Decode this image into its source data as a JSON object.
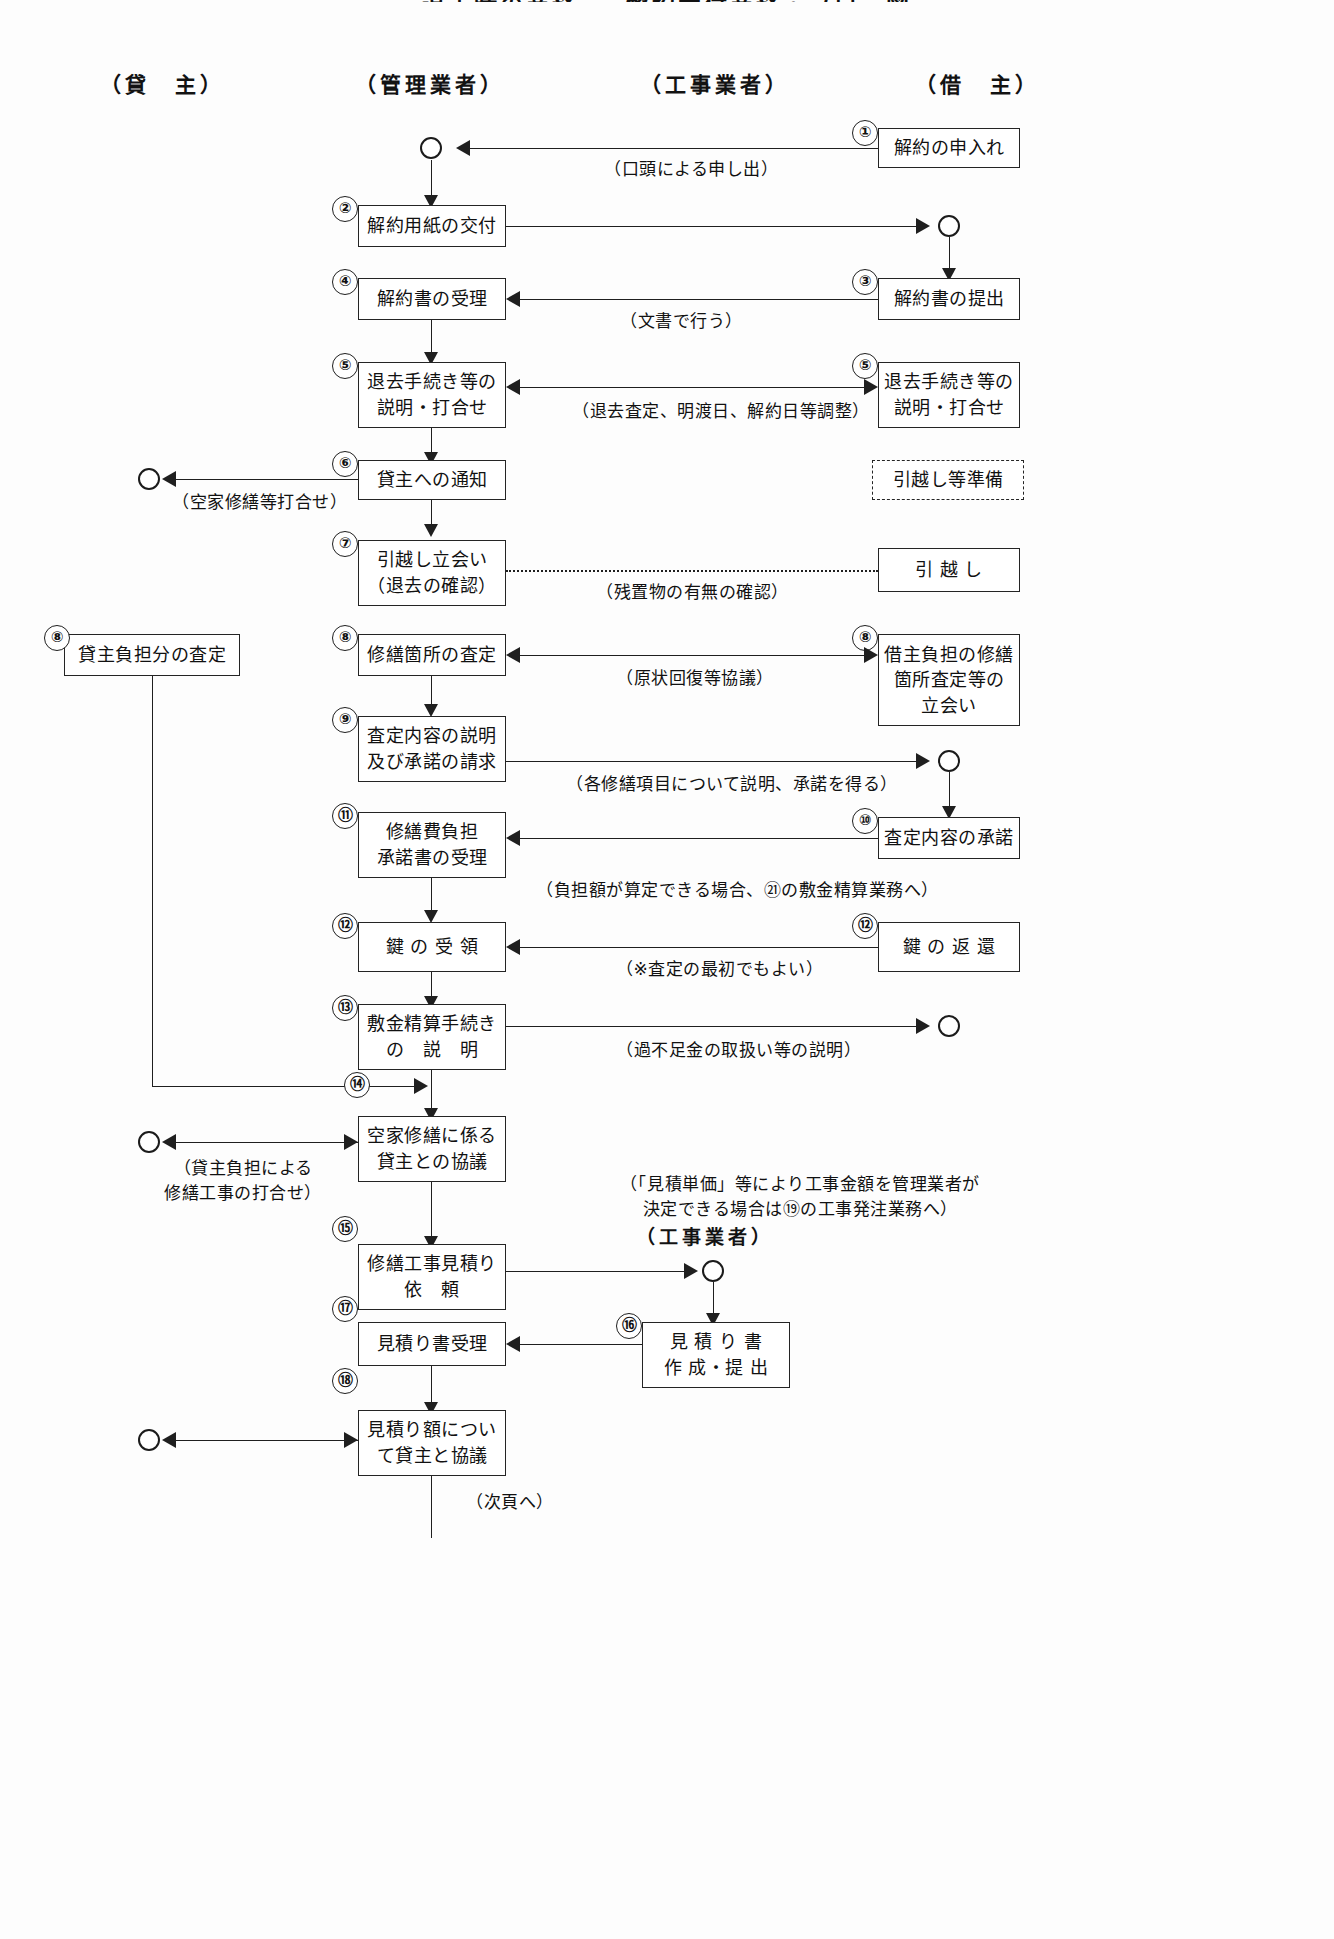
{
  "title": "退去時の業務 — 解約受付業務・フロー図",
  "columns": [
    {
      "id": "lender",
      "label": "（貸　主）"
    },
    {
      "id": "manager",
      "label": "（管理業者）"
    },
    {
      "id": "contractor",
      "label": "（工事業者）"
    },
    {
      "id": "tenant",
      "label": "（借　主）"
    }
  ],
  "contractor_label_lower": "（工事業者）",
  "footer_note": "（次頁へ）",
  "steps": {
    "s01": {
      "num": "①",
      "lines": [
        "解約の申入れ"
      ]
    },
    "s02": {
      "num": "②",
      "lines": [
        "解約用紙の交付"
      ]
    },
    "s03": {
      "num": "③",
      "lines": [
        "解約書の提出"
      ]
    },
    "s04": {
      "num": "④",
      "lines": [
        "解約書の受理"
      ]
    },
    "s05m": {
      "num": "⑤",
      "lines": [
        "退去手続き等の",
        "説明・打合せ"
      ]
    },
    "s05t": {
      "num": "⑤",
      "lines": [
        "退去手続き等の",
        "説明・打合せ"
      ]
    },
    "s06": {
      "num": "⑥",
      "lines": [
        "貸主への通知"
      ]
    },
    "s06t": {
      "num": "",
      "lines": [
        "引越し等準備"
      ]
    },
    "s07": {
      "num": "⑦",
      "lines": [
        "引越し立会い",
        "（退去の確認）"
      ]
    },
    "s07t": {
      "num": "",
      "lines": [
        "引 越 し"
      ]
    },
    "s08l": {
      "num": "⑧",
      "lines": [
        "貸主負担分の査定"
      ]
    },
    "s08m": {
      "num": "⑧",
      "lines": [
        "修繕箇所の査定"
      ]
    },
    "s08t": {
      "num": "⑧",
      "lines": [
        "借主負担の修繕",
        "箇所査定等の",
        "立会い"
      ]
    },
    "s09": {
      "num": "⑨",
      "lines": [
        "査定内容の説明",
        "及び承諾の請求"
      ]
    },
    "s10": {
      "num": "⑩",
      "lines": [
        "査定内容の承諾"
      ]
    },
    "s11": {
      "num": "⑪",
      "lines": [
        "修繕費負担",
        "承諾書の受理"
      ]
    },
    "s12m": {
      "num": "⑫",
      "lines": [
        "鍵 の 受 領"
      ]
    },
    "s12t": {
      "num": "⑫",
      "lines": [
        "鍵 の 返 還"
      ]
    },
    "s13": {
      "num": "⑬",
      "lines": [
        "敷金精算手続き",
        "の　説　明"
      ]
    },
    "s14": {
      "num": "⑭",
      "lines": [
        "空家修繕に係る",
        "貸主との協議"
      ]
    },
    "s15": {
      "num": "⑮",
      "lines": [
        "修繕工事見積り",
        "依　頼"
      ]
    },
    "s16": {
      "num": "⑯",
      "lines": [
        "見 積 り 書",
        "作 成・提 出"
      ]
    },
    "s17": {
      "num": "⑰",
      "lines": [
        "見積り書受理"
      ]
    },
    "s18": {
      "num": "⑱",
      "lines": [
        "見積り額につい",
        "て貸主と協議"
      ]
    }
  },
  "captions": {
    "c01": "（口頭による申し出）",
    "c04": "（文書で行う）",
    "c05": "（退去査定、明渡日、解約日等調整）",
    "c06": "（空家修繕等打合せ）",
    "c07": "（残置物の有無の確認）",
    "c08": "（原状回復等協議）",
    "c09": "（各修繕項目について説明、承諾を得る）",
    "c11": "（負担額が算定できる場合、㉑の敷金精算業務へ）",
    "c12": "（※査定の最初でもよい）",
    "c13": "（過不足金の取扱い等の説明）",
    "c14a": "（貸主負担による",
    "c14b": "修繕工事の打合せ）",
    "c15a": "（「見積単価」等により工事金額を管理業者が",
    "c15b": "決定できる場合は⑲の工事発注業務へ）"
  },
  "colors": {
    "stroke": "#1f1f1f",
    "text": "#111111",
    "background": "#fdfdfd"
  }
}
